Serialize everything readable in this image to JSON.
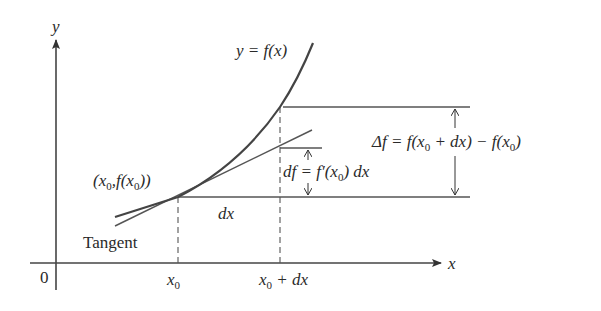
{
  "diagram": {
    "axes": {
      "y_label": "y",
      "x_label": "x",
      "origin_label": "0"
    },
    "curve_label": "y = f(x)",
    "point_label": {
      "open": "(",
      "x": "x",
      "sub": "0",
      "comma": ",",
      "f": "f(",
      "x2": "x",
      "sub2": "0",
      "close": "))"
    },
    "tangent_label": "Tangent",
    "dx_label": "dx",
    "tick_x0": {
      "main": "x",
      "sub": "0"
    },
    "tick_x0_dx": {
      "main": "x",
      "sub": "0",
      "rest": " + dx"
    },
    "df_label": {
      "lhs": "df",
      "eq": " = ",
      "fp": "f′(x",
      "sub": "0",
      "rest": ") dx"
    },
    "delta_f_label": {
      "lhs": "Δf",
      "eq": " = ",
      "a": "f(x",
      "sub1": "0",
      "b": " + dx) − f(x",
      "sub2": "0",
      "c": ")"
    },
    "colors": {
      "curve": "#4a4a4a",
      "lines": "#555555",
      "text": "#2a2a2a"
    }
  }
}
